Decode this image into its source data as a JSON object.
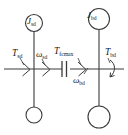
{
  "figure": {
    "type": "drivetrain-torsional-schematic",
    "background_color": "#ffffff",
    "line_color": "#3a3a3a",
    "text_color": "#1a1a1a"
  },
  "labels": {
    "inertia_left": {
      "symbol": "J",
      "subscript": "sd"
    },
    "inertia_right": {
      "symbol": "J",
      "subscript": "bd"
    },
    "torque_left": {
      "symbol": "T",
      "subscript": "sd"
    },
    "torque_right": {
      "symbol": "T",
      "subscript": "bd"
    },
    "speed_left": {
      "symbol": "ω",
      "subscript": "sd"
    },
    "speed_right": {
      "symbol": "ω",
      "subscript": "bd"
    },
    "clutch_torque": {
      "symbol": "T",
      "subscript": "fcmax"
    }
  },
  "elements": {
    "shaft_label": "shaft-line",
    "clutch_label": "clutch-symbol",
    "ground_left_label": "ground-node-left",
    "ground_right_label": "ground-node-right",
    "arrow_left_label": "torque-arrow-left",
    "arrow_mid_left_label": "speed-arrow-left",
    "arrow_mid_right_label": "speed-arrow-right",
    "arrow_right_label": "torque-arrow-right-curved"
  }
}
